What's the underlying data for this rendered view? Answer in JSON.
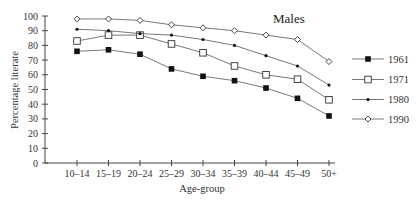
{
  "chart_data": {
    "type": "line",
    "title": "Males",
    "xlabel": "Age-group",
    "ylabel": "Percentage literate",
    "ylim": [
      0,
      100
    ],
    "yticks": [
      0,
      10,
      20,
      30,
      40,
      50,
      60,
      70,
      80,
      90,
      100
    ],
    "grid": false,
    "legend_position": "right",
    "categories": [
      "10–14",
      "15–19",
      "20–24",
      "25–29",
      "30–34",
      "35–39",
      "40–44",
      "45–49",
      "50+"
    ],
    "series": [
      {
        "name": "1961",
        "marker": "filled-square",
        "values": [
          76,
          77,
          74,
          64,
          59,
          56,
          51,
          44,
          32
        ]
      },
      {
        "name": "1971",
        "marker": "open-square",
        "values": [
          83,
          87,
          87,
          81,
          75,
          66,
          60,
          57,
          43
        ]
      },
      {
        "name": "1980",
        "marker": "small-dot",
        "values": [
          91,
          90,
          88,
          87,
          84,
          80,
          73,
          66,
          53
        ]
      },
      {
        "name": "1990",
        "marker": "open-diamond",
        "values": [
          98,
          98,
          97,
          94,
          92,
          90,
          87,
          84,
          69
        ]
      }
    ]
  }
}
